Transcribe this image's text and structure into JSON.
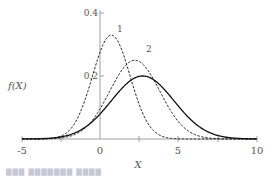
{
  "chart_data": {
    "type": "line",
    "title": "",
    "xlabel": "X",
    "ylabel": "f(X)",
    "xlim": [
      -5,
      10
    ],
    "ylim": [
      0,
      0.4
    ],
    "x_ticks": [
      "-5",
      "0",
      "5",
      "10"
    ],
    "x_minor_ticks": [
      -2.5,
      2.5,
      7.5
    ],
    "y_ticks": [
      "0.2",
      "0.4"
    ],
    "grid": false,
    "legend": "none (curves annotated inline)",
    "series": [
      {
        "name": "1",
        "style": "dashed",
        "distribution": "normal",
        "mean": 0.7,
        "sd": 1.2,
        "peak": 0.33
      },
      {
        "name": "2",
        "style": "dashed",
        "distribution": "normal",
        "mean": 2.2,
        "sd": 1.6,
        "peak": 0.25
      },
      {
        "name": "",
        "style": "solid",
        "distribution": "normal",
        "mean": 2.7,
        "sd": 2.0,
        "peak": 0.2
      }
    ],
    "annotations": [
      {
        "text": "1",
        "x": 1.6,
        "y": 0.35
      },
      {
        "text": "2",
        "x": 3.2,
        "y": 0.27
      }
    ]
  },
  "labels": {
    "ylabel": "f(X)",
    "xlabel": "X",
    "curve1": "1",
    "curve2": "2",
    "xt0": "-5",
    "xt1": "0",
    "xt2": "5",
    "xt3": "10",
    "yt0": "0.2",
    "yt1": "0.4"
  },
  "caption": "▇▇▇  ▇▇▇▇▇▇▇  ▇▇▇▇"
}
